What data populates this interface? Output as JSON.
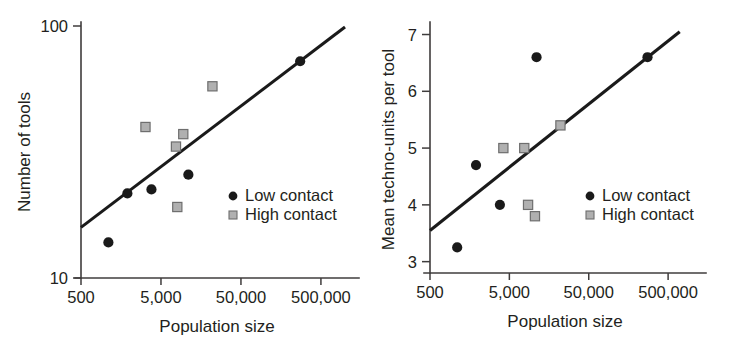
{
  "figure": {
    "background_color": "#ffffff",
    "point_color_low": "#1a1a1a",
    "point_color_high": "#b0b0b0",
    "point_edge_high": "#6e6e6e",
    "line_color": "#1a1a1a",
    "axis_color": "#3f3c3c"
  },
  "chart_data": [
    {
      "type": "scatter",
      "panel": "left",
      "title": "",
      "xlabel": "Population size",
      "ylabel": "Number of tools",
      "xscale": "log",
      "yscale": "log",
      "xlim": [
        500,
        1000000
      ],
      "ylim": [
        10,
        100
      ],
      "xticks": [
        500,
        5000,
        50000,
        500000
      ],
      "xticklabels": [
        "500",
        "5,000",
        "50,000",
        "500,000"
      ],
      "yticks": [
        10,
        100
      ],
      "yticklabels": [
        "10",
        "100"
      ],
      "grid": false,
      "legend_position": "lower right",
      "series": [
        {
          "name": "Low contact",
          "marker": "circle",
          "color": "#1a1a1a",
          "points": [
            {
              "x": 1100,
              "y": 13.3
            },
            {
              "x": 1900,
              "y": 21.0
            },
            {
              "x": 3800,
              "y": 21.8
            },
            {
              "x": 11000,
              "y": 25.0
            },
            {
              "x": 275000,
              "y": 72.0
            }
          ]
        },
        {
          "name": "High contact",
          "marker": "square",
          "color": "#b0b0b0",
          "points": [
            {
              "x": 3200,
              "y": 39.0
            },
            {
              "x": 7700,
              "y": 32.5
            },
            {
              "x": 9500,
              "y": 36.5
            },
            {
              "x": 8000,
              "y": 18.5
            },
            {
              "x": 22000,
              "y": 57.0
            }
          ]
        }
      ],
      "fit_line": {
        "x0": 500,
        "y0": 15.3,
        "x1": 1000000,
        "y1": 99.0
      },
      "legend": [
        {
          "label": "Low contact",
          "marker": "circle"
        },
        {
          "label": "High contact",
          "marker": "square"
        }
      ]
    },
    {
      "type": "scatter",
      "panel": "right",
      "title": "",
      "xlabel": "Population size",
      "ylabel": "Mean techno-units per tool",
      "xscale": "log",
      "yscale": "linear",
      "xlim": [
        500,
        1000000
      ],
      "ylim": [
        2.8,
        7.15
      ],
      "xticks": [
        500,
        5000,
        50000,
        500000
      ],
      "xticklabels": [
        "500",
        "5,000",
        "50,000",
        "500,000"
      ],
      "yticks": [
        3,
        4,
        5,
        6,
        7
      ],
      "yticklabels": [
        "3",
        "4",
        "5",
        "6",
        "7"
      ],
      "grid": false,
      "legend_position": "lower right",
      "series": [
        {
          "name": "Low contact",
          "marker": "circle",
          "color": "#1a1a1a",
          "points": [
            {
              "x": 1100,
              "y": 3.25
            },
            {
              "x": 1900,
              "y": 4.7
            },
            {
              "x": 3800,
              "y": 4.0
            },
            {
              "x": 11000,
              "y": 6.6
            },
            {
              "x": 275000,
              "y": 6.6
            }
          ]
        },
        {
          "name": "High contact",
          "marker": "square",
          "color": "#b0b0b0",
          "points": [
            {
              "x": 4200,
              "y": 5.0
            },
            {
              "x": 7700,
              "y": 5.0
            },
            {
              "x": 8600,
              "y": 4.0
            },
            {
              "x": 10500,
              "y": 3.8
            },
            {
              "x": 22000,
              "y": 5.4
            }
          ]
        }
      ],
      "fit_line": {
        "x0": 500,
        "y0": 3.55,
        "x1": 700000,
        "y1": 7.05
      },
      "legend": [
        {
          "label": "Low contact",
          "marker": "circle"
        },
        {
          "label": "High contact",
          "marker": "square"
        }
      ]
    }
  ]
}
